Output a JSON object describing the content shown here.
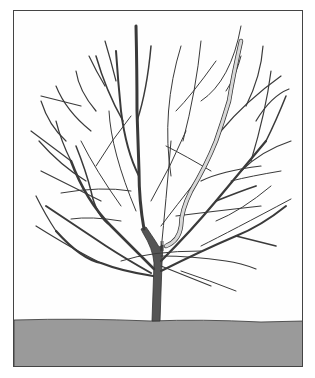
{
  "illustration": {
    "subject": "bare deciduous tree with highlighted pruning branch",
    "colors": {
      "background": "#fefefe",
      "ground": "#9a9a9a",
      "branch": "#3a3a3a",
      "trunk": "#555555",
      "highlight_branch": "#d8d8d8",
      "border": "#444444"
    }
  }
}
